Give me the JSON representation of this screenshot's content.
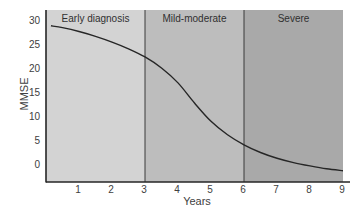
{
  "chart_data": {
    "type": "line",
    "title": "",
    "xlabel": "Years",
    "ylabel": "MMSE",
    "xlim": [
      0,
      9
    ],
    "ylim": [
      -3.7,
      31
    ],
    "x_ticks": [
      1,
      2,
      3,
      4,
      5,
      6,
      7,
      8,
      9
    ],
    "y_ticks": [
      0,
      5,
      10,
      15,
      20,
      25,
      30
    ],
    "grid": false,
    "legend": null,
    "series": [
      {
        "name": "MMSE decline",
        "x": [
          0.15,
          0.5,
          1,
          1.5,
          2,
          2.5,
          3,
          3.5,
          4,
          4.5,
          5,
          5.5,
          6,
          6.5,
          7,
          7.5,
          8,
          8.5,
          9
        ],
        "y": [
          28.8,
          28.4,
          27.6,
          26.6,
          25.4,
          24.0,
          22.3,
          20.0,
          16.9,
          12.7,
          8.9,
          6.1,
          4.0,
          2.4,
          1.2,
          0.3,
          -0.4,
          -1.0,
          -1.4
        ],
        "color": "#262626"
      }
    ],
    "regions": [
      {
        "label": "Early diagnosis",
        "x_start": 0,
        "x_end": 3,
        "color": "#d3d3d3"
      },
      {
        "label": "Mild-moderate",
        "x_start": 3,
        "x_end": 6,
        "color": "#bdbdbd"
      },
      {
        "label": "Severe",
        "x_start": 6,
        "x_end": 9,
        "color": "#a9a9a9"
      }
    ]
  },
  "layout": {
    "plot_left": 46,
    "plot_right": 343,
    "plot_top": 10,
    "plot_bottom": 182,
    "y_zero_px": 164,
    "px_per_unit_y": 4.8,
    "x_axis_end": 350
  }
}
